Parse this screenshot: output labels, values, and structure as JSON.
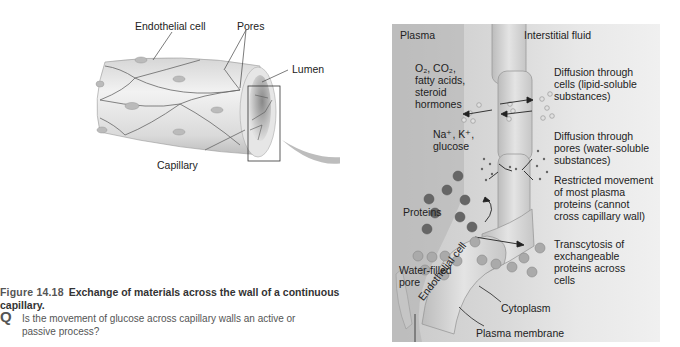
{
  "left_diagram": {
    "labels": {
      "endothelial_cell": "Endothelial cell",
      "pores": "Pores",
      "lumen": "Lumen",
      "capillary": "Capillary"
    }
  },
  "right_diagram": {
    "regions": {
      "plasma": "Plasma",
      "interstitial_fluid": "Interstitial fluid"
    },
    "lipid_substances": [
      "O₂, CO₂,",
      "fatty acids,",
      "steroid",
      "hormones"
    ],
    "ions": [
      "Na⁺, K⁺,",
      "glucose"
    ],
    "proteins": "Proteins",
    "water_filled_pore": [
      "Water-filled",
      "pore"
    ],
    "endothelial_cell": "Endothelial cell",
    "cytoplasm": "Cytoplasm",
    "plasma_membrane": "Plasma membrane",
    "descriptions": {
      "diffusion_cells": [
        "Diffusion through",
        "cells (lipid-soluble",
        "substances)"
      ],
      "diffusion_pores": [
        "Diffusion through",
        "pores (water-soluble",
        "substances)"
      ],
      "restricted": [
        "Restricted movement",
        "of most plasma",
        "proteins (cannot",
        "cross capillary wall)"
      ],
      "transcytosis": [
        "Transcytosis of",
        "exchangeable",
        "proteins across",
        "cells"
      ]
    }
  },
  "caption": {
    "figure_number": "Figure 14.18",
    "title": "Exchange of materials across the wall of a continuous capillary.",
    "question_marker": "Q",
    "question": "Is the movement of glucose across capillary walls an active or passive process?"
  }
}
